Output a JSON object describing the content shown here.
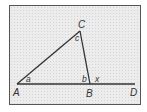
{
  "diagram": {
    "type": "triangle-with-exterior-angle",
    "points": {
      "A": {
        "label": "A",
        "x": 17,
        "y": 84
      },
      "B": {
        "label": "B",
        "x": 90,
        "y": 84
      },
      "C": {
        "label": "C",
        "x": 80,
        "y": 31
      },
      "D": {
        "label": "D",
        "x": 135,
        "y": 84
      }
    },
    "angles": {
      "a": "a",
      "b": "b",
      "c": "c",
      "x": "x"
    },
    "colors": {
      "line": "#333333",
      "frame": "#555555",
      "background": "#ececec"
    }
  }
}
